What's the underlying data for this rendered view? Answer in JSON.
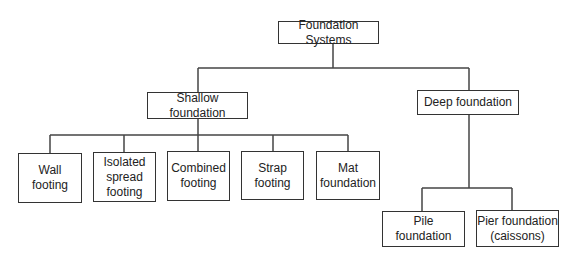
{
  "diagram": {
    "type": "hierarchy",
    "root": {
      "id": "root",
      "label": "Foundation Systems"
    },
    "nodes": [
      {
        "id": "shallow",
        "label": "Shallow foundation",
        "parent": "root"
      },
      {
        "id": "deep",
        "label": "Deep foundation",
        "parent": "root"
      },
      {
        "id": "wall",
        "label": "Wall\nfooting",
        "parent": "shallow"
      },
      {
        "id": "isolated",
        "label": "Isolated\nspread\nfooting",
        "parent": "shallow"
      },
      {
        "id": "combined",
        "label": "Combined\nfooting",
        "parent": "shallow"
      },
      {
        "id": "strap",
        "label": "Strap\nfooting",
        "parent": "shallow"
      },
      {
        "id": "mat",
        "label": "Mat\nfoundation",
        "parent": "shallow"
      },
      {
        "id": "pile",
        "label": "Pile\nfoundation",
        "parent": "deep"
      },
      {
        "id": "pier",
        "label": "Pier foundation\n(caissons)",
        "parent": "deep"
      }
    ]
  },
  "colors": {
    "line": "#333333",
    "background": "#ffffff"
  }
}
